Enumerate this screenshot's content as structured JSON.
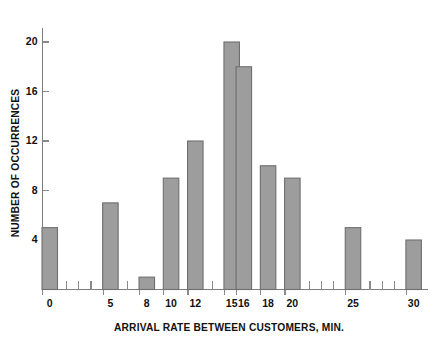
{
  "chart_data": {
    "type": "bar",
    "title": "",
    "subtitle": "",
    "xlabel": "ARRIVAL RATE BETWEEN CUSTOMERS, MIN.",
    "ylabel": "NUMBER OF OCCURRENCES",
    "categories": [
      "0",
      "5",
      "8",
      "10",
      "12",
      "15",
      "16",
      "18",
      "20",
      "25",
      "30"
    ],
    "x": [
      0,
      5,
      8,
      10,
      12,
      15,
      16,
      18,
      20,
      25,
      30
    ],
    "values": [
      5,
      7,
      1,
      9,
      12,
      20,
      18,
      10,
      9,
      5,
      4
    ],
    "bars": [
      {
        "x": 0,
        "label": "0",
        "value": 5
      },
      {
        "x": 5,
        "label": "5",
        "value": 7
      },
      {
        "x": 8,
        "label": "8",
        "value": 1
      },
      {
        "x": 10,
        "label": "10",
        "value": 9
      },
      {
        "x": 12,
        "label": "12",
        "value": 12
      },
      {
        "x": 15,
        "label": "15",
        "value": 20
      },
      {
        "x": 16,
        "label": "16",
        "value": 18
      },
      {
        "x": 18,
        "label": "18",
        "value": 10
      },
      {
        "x": 20,
        "label": "20",
        "value": 9
      },
      {
        "x": 25,
        "label": "25",
        "value": 5
      },
      {
        "x": 30,
        "label": "30",
        "value": 4
      }
    ],
    "xlim": [
      -1,
      31.5
    ],
    "ylim": [
      0,
      21.5
    ],
    "ytick_labels": [
      "4",
      "8",
      "12",
      "16",
      "20"
    ],
    "yticks": [
      4,
      8,
      12,
      16,
      20
    ],
    "xtick_labels": [
      "0",
      "5",
      "8",
      "10",
      "12",
      "15",
      "16",
      "18",
      "20",
      "25",
      "30"
    ],
    "xticks_major": [
      0,
      5,
      8,
      10,
      12,
      15,
      16,
      18,
      20,
      25,
      30
    ],
    "xticks_minor": [
      1,
      2,
      3,
      4,
      6,
      7,
      9,
      11,
      13,
      14,
      17,
      19,
      21,
      22,
      23,
      24,
      26,
      27,
      28,
      29
    ],
    "grid": false,
    "legend": null,
    "legend_position": "none",
    "bar_color": "#9d9d9d",
    "bar_edge_color": "#6f6f6f",
    "axis_color": "#7d7d7d",
    "text_color": "#111111",
    "background_color": "#ffffff"
  }
}
